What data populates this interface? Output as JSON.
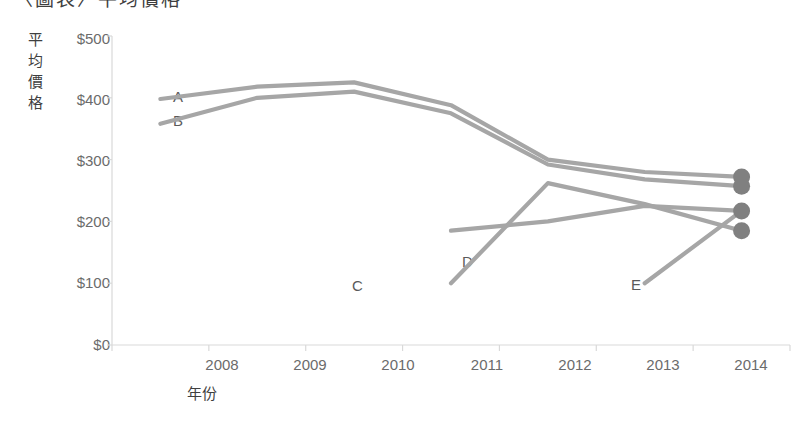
{
  "chart_data": {
    "type": "line",
    "title": "〈圖表〉平均價格",
    "xlabel": "年份",
    "ylabel": "平均價格",
    "categories": [
      "2008",
      "2009",
      "2010",
      "2011",
      "2012",
      "2013",
      "2014"
    ],
    "x_tick_labels": [
      "2008",
      "2009",
      "2010",
      "2011",
      "2012",
      "2013",
      "2014"
    ],
    "y_tick_labels": [
      "$500",
      "$400",
      "$300",
      "$200",
      "$100",
      "$0"
    ],
    "y_tick_values": [
      500,
      400,
      300,
      200,
      100,
      0
    ],
    "ylim": [
      0,
      500
    ],
    "grid": false,
    "legend_position": "inline-labels",
    "line_color": "#a6a6a6",
    "marker_color": "#808080",
    "series": [
      {
        "name": "A",
        "label": "A",
        "values": [
          398,
          418,
          425,
          388,
          300,
          280,
          272
        ],
        "end_marker": true
      },
      {
        "name": "B",
        "label": "B",
        "values": [
          358,
          400,
          410,
          375,
          292,
          268,
          257
        ],
        "end_marker": true
      },
      {
        "name": "C",
        "label": "C",
        "values": [
          null,
          null,
          null,
          100,
          262,
          228,
          185
        ],
        "end_marker": true
      },
      {
        "name": "D",
        "label": "D",
        "values": [
          null,
          null,
          null,
          185,
          200,
          225,
          217
        ],
        "end_marker": true
      },
      {
        "name": "E",
        "label": "E",
        "values": [
          null,
          null,
          null,
          null,
          null,
          100,
          217
        ],
        "end_marker": false
      }
    ],
    "series_label_positions": [
      {
        "name": "A",
        "left": 173,
        "top": 88
      },
      {
        "name": "B",
        "left": 173,
        "top": 112
      },
      {
        "name": "C",
        "left": 352,
        "top": 277
      },
      {
        "name": "D",
        "left": 462,
        "top": 253
      },
      {
        "name": "E",
        "left": 631,
        "top": 276
      }
    ]
  }
}
